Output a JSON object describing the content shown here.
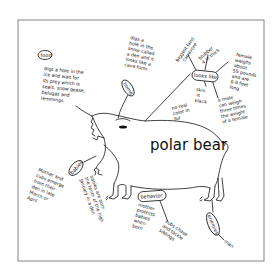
{
  "diagram": {
    "type": "concept-map",
    "center_label": "polar bear",
    "branches": [
      {
        "id": "food",
        "label": "food",
        "notes": [
          "digs a hole in the ice and wait for its prey which is seals, snow geese, belugas and lemmings"
        ]
      },
      {
        "id": "home",
        "label": "home",
        "notes": [
          "digs a hole in the snow called a den and it looks like a cave form"
        ]
      },
      {
        "id": "looks-like",
        "label": "looks like",
        "notes": [
          "biggest land carnivore",
          "blubber 4 in thick",
          "female weighs about 55 pounds and are 6-8 feet long",
          "skin is black",
          "no real color in fur",
          "a male can weigh three times the weight of a female"
        ]
      },
      {
        "id": "babies",
        "label": "babies",
        "notes": [
          "Mother and cubs emerge from their den in late March or April",
          "babies are born the tenth of the high January in a den"
        ]
      },
      {
        "id": "behavior",
        "label": "behavior",
        "notes": [
          "mother protects babies when born",
          "cubs chase and tackle siblings"
        ]
      },
      {
        "id": "enemies",
        "label": "enemies",
        "notes": [
          "man"
        ]
      }
    ]
  }
}
